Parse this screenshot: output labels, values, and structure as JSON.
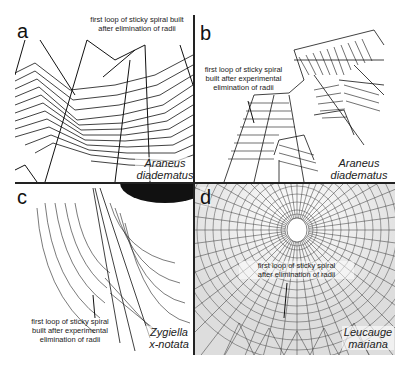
{
  "figure": {
    "panels": [
      {
        "id": "a",
        "letter": "a",
        "annotation": [
          "first loop of sticky spiral built",
          "after elimination of radii"
        ],
        "species": [
          "Araneus",
          "diadematus"
        ]
      },
      {
        "id": "b",
        "letter": "b",
        "annotation": [
          "first loop of sticky spiral",
          "built after experimental",
          "elimination of radii"
        ],
        "species": [
          "Araneus",
          "diadematus"
        ]
      },
      {
        "id": "c",
        "letter": "c",
        "annotation": [
          "first loop of sticky spiral",
          "built after experimental",
          "elimination of radii"
        ],
        "species": [
          "Zygiella",
          "x-notata"
        ]
      },
      {
        "id": "d",
        "letter": "d",
        "annotation": [
          "first loop of sticky spiral",
          "after elimination of radii"
        ],
        "species": [
          "Leucauge",
          "mariana"
        ]
      }
    ],
    "colors": {
      "ink": "#222222",
      "background": "#ffffff"
    }
  }
}
